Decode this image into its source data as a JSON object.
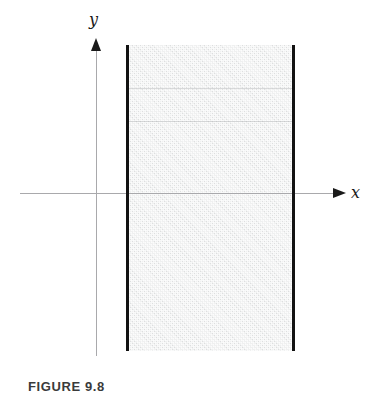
{
  "figure": {
    "caption": "FIGURE 9.8",
    "background_color": "#ffffff"
  },
  "axes": {
    "x_label": "x",
    "y_label": "y",
    "axis_color": "#a9a9ac",
    "arrow_color": "#1a1a1a"
  },
  "region": {
    "fill_color": "#eff0f0",
    "boundary_color": "#121212"
  },
  "chart_data": {
    "type": "area",
    "title": "",
    "subtitle": "",
    "xlabel": "x",
    "ylabel": "y",
    "grid": false,
    "legend": null,
    "series": [
      {
        "name": "shaded-strip",
        "kind": "filled-region",
        "fill": "#eff0f0",
        "x_range": [
          127,
          293
        ],
        "y_range": [
          45,
          351
        ]
      },
      {
        "name": "left-boundary-line",
        "kind": "vertical-line",
        "x": 127,
        "color": "#121212",
        "linewidth": 3
      },
      {
        "name": "right-boundary-line",
        "kind": "vertical-line",
        "x": 293,
        "color": "#121212",
        "linewidth": 3
      }
    ],
    "annotations": [
      {
        "text": "y",
        "x": 95,
        "y": 20,
        "style": "italic-serif"
      },
      {
        "text": "x",
        "x": 355,
        "y": 192,
        "style": "italic-serif"
      }
    ],
    "axis_origin": {
      "x": 96,
      "y": 193
    },
    "xlim": [
      20,
      336
    ],
    "ylim": [
      44,
      356
    ]
  }
}
